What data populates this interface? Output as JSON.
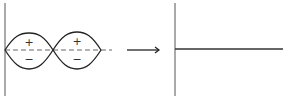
{
  "diagram": {
    "left_panel": {
      "lobes": [
        {
          "upper_sign": "+",
          "lower_sign": "−"
        },
        {
          "upper_sign": "+",
          "lower_sign": "−"
        }
      ]
    },
    "transition": {
      "icon": "right-arrow-icon"
    },
    "right_panel": {
      "description": "flat line"
    },
    "colors": {
      "stroke": "#222222",
      "axis": "#555555",
      "dashed": "#666666"
    }
  }
}
